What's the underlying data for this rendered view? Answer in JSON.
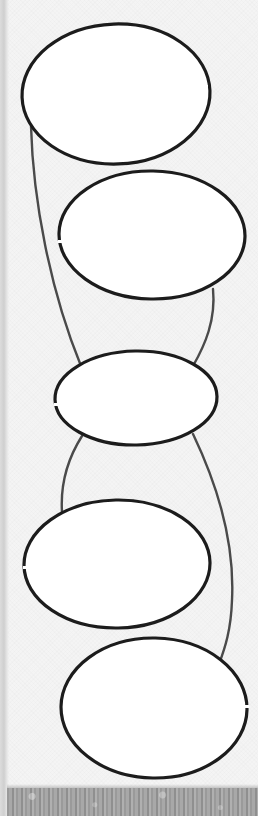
{
  "diagram": {
    "type": "hand-drawn graphic organizer",
    "background_color": "#f4f4f4",
    "stroke_color": "#1c1c1c",
    "connector_color": "#4a4a4a",
    "nodes": [
      {
        "id": "oval-1",
        "cx": 116,
        "cy": 94,
        "rx": 94,
        "ry": 70,
        "label": ""
      },
      {
        "id": "oval-2",
        "cx": 152,
        "cy": 235,
        "rx": 93,
        "ry": 65,
        "label": ""
      },
      {
        "id": "oval-3",
        "cx": 136,
        "cy": 398,
        "rx": 81,
        "ry": 48,
        "label": ""
      },
      {
        "id": "oval-4",
        "cx": 117,
        "cy": 564,
        "rx": 93,
        "ry": 64,
        "label": ""
      },
      {
        "id": "oval-5",
        "cx": 154,
        "cy": 708,
        "rx": 93,
        "ry": 70,
        "label": ""
      }
    ],
    "edges": [
      {
        "from": "oval-1",
        "to": "oval-3"
      },
      {
        "from": "oval-2",
        "to": "oval-3"
      },
      {
        "from": "oval-3",
        "to": "oval-4"
      },
      {
        "from": "oval-3",
        "to": "oval-5"
      }
    ]
  }
}
